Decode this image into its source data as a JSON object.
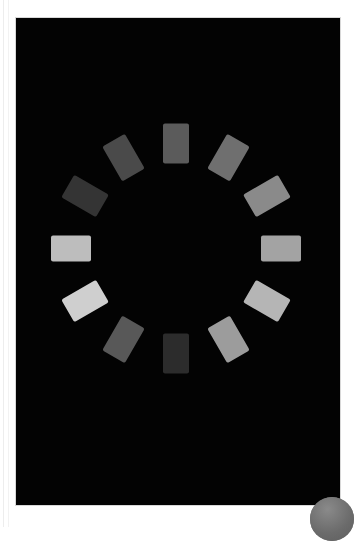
{
  "page": {
    "background_color": "#ffffff",
    "width": 356,
    "height": 527
  },
  "viewer_panel": {
    "name": "media-viewer-panel",
    "background_color": "#030303",
    "border_color": "#d8d8d8",
    "x": 16,
    "y": 18,
    "width": 324,
    "height": 487
  },
  "spinner": {
    "label": "",
    "type": "segmented-activity-indicator",
    "segment_count": 12,
    "center_x": 176,
    "center_y": 248,
    "radius": 105,
    "blade_width": 26,
    "blade_height": 40,
    "segments": [
      {
        "index": 0,
        "clock": "12:00",
        "angle_deg": 0,
        "color": "#5b5b5b"
      },
      {
        "index": 1,
        "clock": "1:00",
        "angle_deg": 30,
        "color": "#6f6f6f"
      },
      {
        "index": 2,
        "clock": "2:00",
        "angle_deg": 60,
        "color": "#8a8a8a"
      },
      {
        "index": 3,
        "clock": "3:00",
        "angle_deg": 90,
        "color": "#a3a3a3"
      },
      {
        "index": 4,
        "clock": "4:00",
        "angle_deg": 120,
        "color": "#b5b5b5"
      },
      {
        "index": 5,
        "clock": "5:00",
        "angle_deg": 150,
        "color": "#9c9c9c"
      },
      {
        "index": 6,
        "clock": "6:00",
        "angle_deg": 180,
        "color": "#2c2c2c"
      },
      {
        "index": 7,
        "clock": "7:00",
        "angle_deg": 210,
        "color": "#585858"
      },
      {
        "index": 8,
        "clock": "8:00",
        "angle_deg": 240,
        "color": "#cfcfcf"
      },
      {
        "index": 9,
        "clock": "9:00",
        "angle_deg": 270,
        "color": "#bdbdbd"
      },
      {
        "index": 10,
        "clock": "10:00",
        "angle_deg": 300,
        "color": "#343434"
      },
      {
        "index": 11,
        "clock": "11:00",
        "angle_deg": 330,
        "color": "#4a4a4a"
      }
    ]
  },
  "corner_badge": {
    "name": "corner-badge",
    "color": "#6f6f6f",
    "shape": "circle",
    "clipped": true
  }
}
